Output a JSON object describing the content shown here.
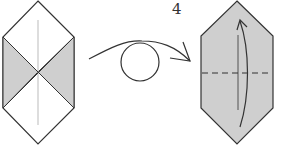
{
  "diagram": {
    "type": "origami-instruction-step",
    "step_number": "4",
    "colors": {
      "paper_front": "#ffffff",
      "paper_back": "#cfcfcf",
      "line": "#333333",
      "guide_line": "#bbbbbb"
    },
    "panels": [
      {
        "id": "before",
        "description": "Hexagonal folded shape with left and right triangles showing colored side, vertical center crease",
        "shape": "elongated-hexagon"
      },
      {
        "id": "action",
        "description": "Turn over symbol: curved arrow over a circle"
      },
      {
        "id": "after",
        "description": "Hexagon fully colored with horizontal valley fold dashed line and curved arrow indicating fold bottom up",
        "fold_line": "valley-horizontal-center",
        "arrow": "fold-up"
      }
    ]
  }
}
